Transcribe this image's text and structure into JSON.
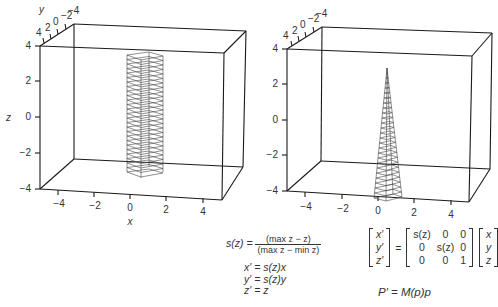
{
  "chart_data": [
    {
      "type": "3d-wireframe",
      "title": "",
      "description": "Original mesh: vertical square column (prism) centered near x=0,y=0 spanning z from about -2.5 to 3",
      "xlabel": "x",
      "ylabel": "y",
      "zlabel": "z",
      "xlim": [
        -5,
        5
      ],
      "ylim": [
        -4,
        4
      ],
      "zlim": [
        -4,
        4
      ],
      "x_ticks": [
        "-4",
        "-2",
        "0",
        "2",
        "4"
      ],
      "y_ticks": [
        "4",
        "2",
        "0",
        "-2",
        "-4"
      ],
      "z_ticks": [
        "4",
        "2",
        "0",
        "-2",
        "-4"
      ],
      "object": "column",
      "z_range": [
        -2.5,
        3.2
      ],
      "cross_section_halfwidth": 0.5,
      "horizontal_slices": 26
    },
    {
      "type": "3d-wireframe",
      "title": "",
      "description": "Tapered mesh: same column after taper deformation, shrinking to a point at max z",
      "xlabel": "",
      "ylabel": "",
      "zlabel": "",
      "xlim": [
        -5,
        5
      ],
      "ylim": [
        -4,
        4
      ],
      "zlim": [
        -4,
        4
      ],
      "x_ticks": [
        "-4",
        "-2",
        "0",
        "2",
        "4"
      ],
      "y_ticks": [
        "4",
        "2",
        "0",
        "-2",
        "-4"
      ],
      "z_ticks": [
        "4",
        "2",
        "0",
        "-2",
        "-4"
      ],
      "object": "tapered-spike",
      "z_range": [
        -2.5,
        3.2
      ],
      "horizontal_slices": 26
    }
  ],
  "plots": {
    "left": {
      "x_axis_label": "x",
      "y_axis_label": "y",
      "z_axis_label": "z",
      "x_ticks": [
        "−4",
        "−2",
        "0",
        "2",
        "4"
      ],
      "y_ticks": [
        "4",
        "2",
        "0",
        "−2",
        "−4"
      ],
      "z_ticks": [
        "4",
        "2",
        "0",
        "−2",
        "−4"
      ]
    },
    "right": {
      "x_ticks": [
        "−4",
        "−2",
        "0",
        "2",
        "4"
      ],
      "y_ticks": [
        "4",
        "2",
        "0",
        "−2",
        "−4"
      ],
      "z_ticks": [
        "4",
        "2",
        "0",
        "−2",
        "−4"
      ]
    }
  },
  "equations": {
    "scale": {
      "lhs": "s(z) =",
      "numerator": "(max z − z)",
      "denominator": "(max z − min z)"
    },
    "component_lines": [
      "x′ = s(z)x",
      "y′ = s(z)y",
      "z′ = z"
    ],
    "matrix_eq": {
      "lhs_vector": [
        "x′",
        "y′",
        "z′"
      ],
      "equals": "=",
      "matrix": [
        [
          "s(z)",
          "0",
          "0"
        ],
        [
          "0",
          "s(z)",
          "0"
        ],
        [
          "0",
          "0",
          "1"
        ]
      ],
      "rhs_vector": [
        "x",
        "y",
        "z"
      ]
    },
    "compact": "P′ = M(p)p"
  },
  "colors": {
    "line": "#1a1a1a",
    "mesh": "#444444",
    "text": "#333333",
    "background": "#ffffff"
  }
}
